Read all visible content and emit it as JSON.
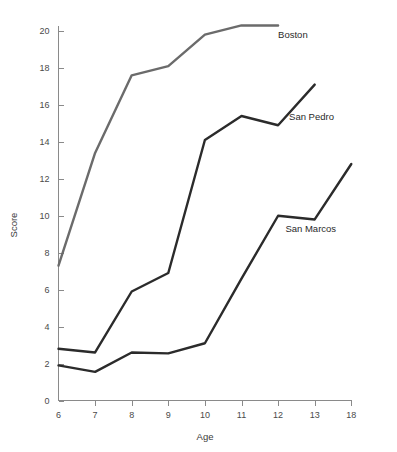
{
  "chart_data": {
    "type": "line",
    "title": "",
    "xlabel": "Age",
    "ylabel": "Score",
    "x": [
      6,
      7,
      8,
      9,
      10,
      11,
      12,
      13,
      18
    ],
    "x_tick_labels": [
      "6",
      "7",
      "8",
      "9",
      "10",
      "11",
      "12",
      "13",
      "18"
    ],
    "y_tick_labels": [
      "0",
      "2",
      "4",
      "6",
      "8",
      "10",
      "12",
      "14",
      "16",
      "18",
      "20"
    ],
    "y_ticks": [
      0,
      2,
      4,
      6,
      8,
      10,
      12,
      14,
      16,
      18,
      20
    ],
    "ylim": [
      0,
      20.8
    ],
    "grid": false,
    "legend_position": "inline-end-of-line",
    "series": [
      {
        "name": "Boston",
        "color": "#6b6b6b",
        "x": [
          6,
          7,
          8,
          9,
          10,
          11,
          12
        ],
        "values": [
          7.3,
          13.4,
          17.6,
          18.1,
          19.8,
          20.3,
          20.3
        ],
        "label": "Boston"
      },
      {
        "name": "San Pedro",
        "color": "#2b2b2b",
        "x": [
          6,
          7,
          8,
          9,
          10,
          11,
          12,
          13
        ],
        "values": [
          2.8,
          2.6,
          5.9,
          6.9,
          14.1,
          15.4,
          14.9,
          17.1
        ],
        "label": "San Pedro"
      },
      {
        "name": "San Marcos",
        "color": "#2b2b2b",
        "x": [
          6,
          7,
          8,
          9,
          10,
          11,
          12,
          13,
          18
        ],
        "values": [
          1.9,
          1.55,
          2.6,
          2.55,
          3.1,
          6.6,
          10.0,
          9.8,
          12.8
        ],
        "label": "San Marcos"
      }
    ],
    "annotations": [
      {
        "text": "Boston",
        "x_age": 12,
        "y_value": 19.6
      },
      {
        "text": "San Pedro",
        "x_age": 12.3,
        "y_value": 15.2
      },
      {
        "text": "San Marcos",
        "x_age": 12.2,
        "y_value": 9.1
      }
    ]
  },
  "axes": {
    "x_title": "Age",
    "y_title": "Score"
  }
}
